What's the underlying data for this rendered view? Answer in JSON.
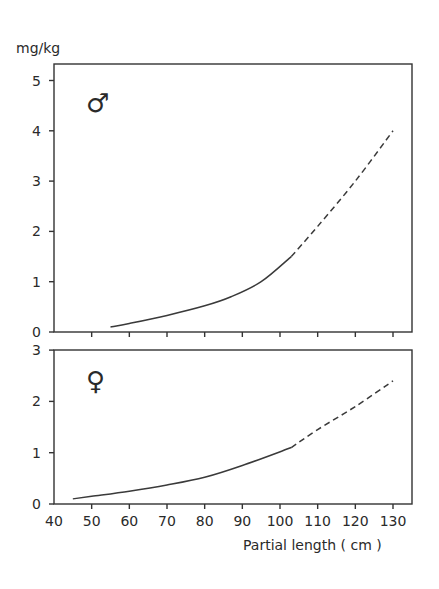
{
  "chart_data": [
    {
      "type": "line",
      "panel": "top",
      "title": "",
      "symbol": "♂",
      "symbol_meaning": "male",
      "ylabel": "mg/kg",
      "xlabel": "Partial length ( cm )",
      "ylim": [
        0,
        5.3
      ],
      "xlim": [
        40,
        135
      ],
      "yticks": [
        0,
        1,
        2,
        3,
        4,
        5
      ],
      "xticks": [
        40,
        50,
        60,
        70,
        80,
        90,
        100,
        110,
        120,
        130
      ],
      "grid": false,
      "series": [
        {
          "name": "male (observed range)",
          "style": "solid",
          "x": [
            55,
            60,
            70,
            80,
            87,
            95,
            103
          ],
          "y": [
            0.1,
            0.17,
            0.33,
            0.52,
            0.7,
            1.0,
            1.5
          ]
        },
        {
          "name": "male (extrapolated)",
          "style": "dashed",
          "x": [
            103,
            110,
            120,
            130
          ],
          "y": [
            1.5,
            2.1,
            3.0,
            4.0
          ]
        }
      ]
    },
    {
      "type": "line",
      "panel": "bottom",
      "title": "",
      "symbol": "♀",
      "symbol_meaning": "female",
      "ylabel": "mg/kg",
      "xlabel": "Partial length ( cm )",
      "ylim": [
        0,
        3
      ],
      "xlim": [
        40,
        135
      ],
      "yticks": [
        0,
        1,
        2,
        3
      ],
      "xticks": [
        40,
        50,
        60,
        70,
        80,
        90,
        100,
        110,
        120,
        130
      ],
      "grid": false,
      "series": [
        {
          "name": "female (observed range)",
          "style": "solid",
          "x": [
            45,
            50,
            60,
            70,
            80,
            90,
            103
          ],
          "y": [
            0.1,
            0.15,
            0.25,
            0.37,
            0.52,
            0.75,
            1.1
          ]
        },
        {
          "name": "female (extrapolated)",
          "style": "dashed",
          "x": [
            103,
            110,
            120,
            130
          ],
          "y": [
            1.1,
            1.45,
            1.9,
            2.4
          ]
        }
      ]
    }
  ],
  "labels": {
    "y_unit": "mg/kg",
    "x_axis": "Partial length ( cm )",
    "male_symbol": "♂",
    "female_symbol": "♀",
    "top_yticks": [
      "0",
      "1",
      "2",
      "3",
      "4",
      "5"
    ],
    "bottom_yticks": [
      "0",
      "1",
      "2",
      "3"
    ],
    "xticks": [
      "40",
      "50",
      "60",
      "70",
      "80",
      "90",
      "100",
      "110",
      "120",
      "130"
    ]
  }
}
